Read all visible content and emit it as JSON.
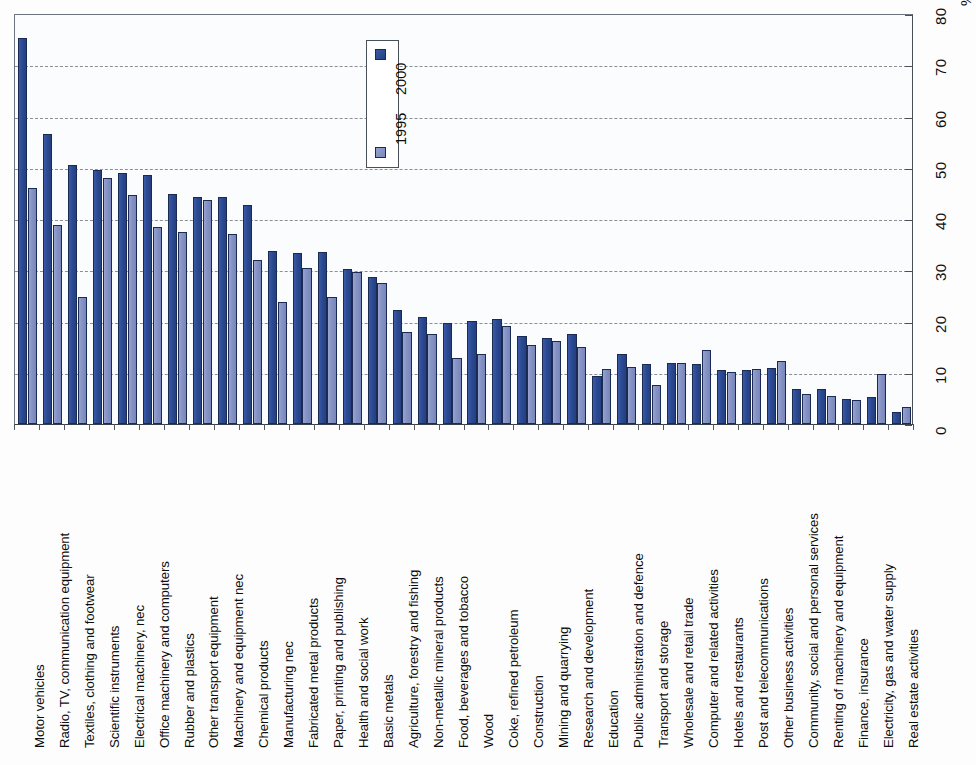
{
  "chart": {
    "axis_unit_label": "%",
    "y_ticks": [
      "0",
      "10",
      "20",
      "30",
      "40",
      "50",
      "60",
      "70",
      "80"
    ],
    "legend": {
      "title": "",
      "entries": [
        {
          "label": "2000",
          "color": "#2c4a93"
        },
        {
          "label": "1995",
          "color": "#8492c4"
        }
      ]
    }
  },
  "chart_data": {
    "type": "bar",
    "title": "",
    "subtitle": "",
    "xlabel": "",
    "ylabel": "%",
    "ylim": [
      0,
      80
    ],
    "grid": true,
    "orientation": "vertical-bars-rotated-90ccw",
    "legend_position": "top-center",
    "categories": [
      "Motor vehicles",
      "Radio, TV, communication equipment",
      "Textiles, clothing and footwear",
      "Scientific instruments",
      "Electrical machinery, nec",
      "Office machinery and computers",
      "Rubber and plastics",
      "Other transport equipment",
      "Machinery and equipment nec",
      "Chemical products",
      "Manufacturing nec",
      "Fabricated metal products",
      "Paper, printing and publishing",
      "Health and social work",
      "Basic metals",
      "Agriculture, forestry and fishing",
      "Non-metallic mineral products",
      "Food, beverages and tobacco",
      "Wood",
      "Coke, refined petroleum",
      "Construction",
      "Mining and quarrying",
      "Research and development",
      "Education",
      "Public administration and defence",
      "Transport and storage",
      "Wholesale and retail trade",
      "Computer and related activities",
      "Hotels and restaurants",
      "Post and telecommunications",
      "Other business activities",
      "Community, social and personal services",
      "Renting of machinery and equipment",
      "Finance, insurance",
      "Electricity, gas and water supply",
      "Real estate activities"
    ],
    "series": [
      {
        "name": "2000",
        "color": "#2c4a93",
        "values": [
          75.3,
          56.5,
          50.5,
          49.5,
          49.0,
          48.5,
          44.8,
          44.3,
          44.2,
          42.7,
          33.7,
          33.3,
          33.5,
          30.2,
          28.6,
          22.3,
          20.9,
          19.8,
          20.1,
          20.4,
          17.2,
          16.8,
          17.6,
          9.3,
          13.7,
          11.7,
          11.9,
          11.8,
          10.5,
          10.5,
          11.0,
          6.8,
          6.9,
          4.8,
          5.2,
          2.3
        ]
      },
      {
        "name": "1995",
        "color": "#8492c4",
        "values": [
          46.0,
          38.9,
          24.7,
          48.0,
          44.6,
          38.5,
          37.5,
          43.8,
          37.0,
          32.1,
          23.8,
          30.4,
          24.7,
          29.7,
          27.6,
          17.9,
          17.5,
          12.8,
          13.6,
          19.2,
          15.5,
          16.2,
          15.1,
          10.8,
          11.1,
          7.6,
          12.0,
          14.4,
          10.2,
          10.8,
          12.2,
          5.9,
          5.5,
          4.6,
          9.8,
          3.3
        ]
      }
    ]
  }
}
